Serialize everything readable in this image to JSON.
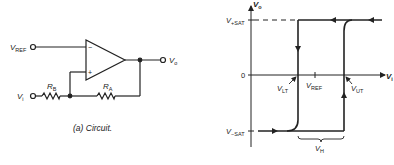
{
  "circuit": {
    "caption": "(a)  Circuit.",
    "labels": {
      "v_ref": "V",
      "v_ref_sub": "REF",
      "v_i": "V",
      "v_i_sub": "i",
      "v_o": "V",
      "v_o_sub": "o",
      "r_b": "R",
      "r_b_sub": "B",
      "r_a": "R",
      "r_a_sub": "A",
      "minus": "−",
      "plus": "+"
    }
  },
  "graph": {
    "y_axis": {
      "label": "V",
      "label_sub": "o"
    },
    "x_axis": {
      "label": "V",
      "label_sub": "i"
    },
    "ticks": {
      "v_pos_sat": "V",
      "v_pos_sat_sub": "+SAT",
      "zero": "0",
      "v_neg_sat": "V",
      "v_neg_sat_sub": "−SAT"
    },
    "annotations": {
      "v_lt": "V",
      "v_lt_sub": "LT",
      "v_ref": "V",
      "v_ref_sub": "REF",
      "v_ut": "V",
      "v_ut_sub": "UT",
      "v_h": "V",
      "v_h_sub": "H"
    }
  }
}
